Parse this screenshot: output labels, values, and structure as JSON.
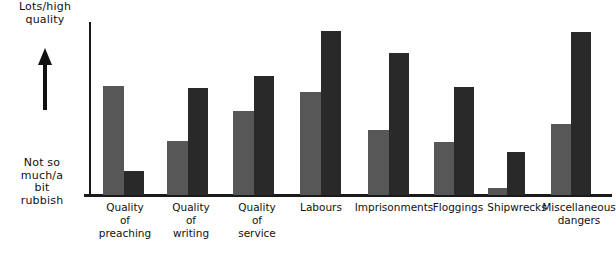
{
  "chart_data": {
    "type": "bar",
    "title": "",
    "subtitle": "",
    "xlabel": "",
    "ylabel": "",
    "grid": false,
    "legend": "none",
    "axis_annotations": {
      "y_top": "Lots/high\nquality",
      "y_bottom": "Not so\nmuch/a\nbit\nrubbish",
      "y_arrow": "up-arrow"
    },
    "ylim": [
      0,
      100
    ],
    "categories": [
      "Quality\nof\npreaching",
      "Quality\nof\nwriting",
      "Quality\nof\nservice",
      "Labours",
      "Imprisonments",
      "Floggings",
      "Shipwrecks",
      "Miscellaneous\ndangers"
    ],
    "series": [
      {
        "name": "light-series",
        "color": "#575757",
        "values": [
          63,
          31,
          49,
          60,
          38,
          31,
          4,
          41
        ]
      },
      {
        "name": "dark-series",
        "color": "#292929",
        "values": [
          14,
          62,
          69,
          95,
          82,
          62,
          25,
          94
        ]
      }
    ]
  },
  "bars": [
    {
      "category_index": 0,
      "series": "light",
      "x": 103,
      "width": 21,
      "top": 86,
      "value": 63
    },
    {
      "category_index": 0,
      "series": "dark",
      "x": 124,
      "width": 20,
      "top": 171,
      "value": 14
    },
    {
      "category_index": 1,
      "series": "light",
      "x": 167,
      "width": 21,
      "top": 141,
      "value": 31
    },
    {
      "category_index": 1,
      "series": "dark",
      "x": 188,
      "width": 20,
      "top": 88,
      "value": 62
    },
    {
      "category_index": 2,
      "series": "light",
      "x": 233,
      "width": 21,
      "top": 111,
      "value": 49
    },
    {
      "category_index": 2,
      "series": "dark",
      "x": 254,
      "width": 20,
      "top": 76,
      "value": 69
    },
    {
      "category_index": 3,
      "series": "light",
      "x": 300,
      "width": 21,
      "top": 92,
      "value": 60
    },
    {
      "category_index": 3,
      "series": "dark",
      "x": 321,
      "width": 20,
      "top": 31,
      "value": 95
    },
    {
      "category_index": 4,
      "series": "light",
      "x": 368,
      "width": 21,
      "top": 130,
      "value": 38
    },
    {
      "category_index": 4,
      "series": "dark",
      "x": 389,
      "width": 20,
      "top": 53,
      "value": 82
    },
    {
      "category_index": 5,
      "series": "light",
      "x": 434,
      "width": 20,
      "top": 142,
      "value": 31
    },
    {
      "category_index": 5,
      "series": "dark",
      "x": 454,
      "width": 20,
      "top": 87,
      "value": 62
    },
    {
      "category_index": 6,
      "series": "light",
      "x": 488,
      "width": 19,
      "top": 188,
      "value": 4
    },
    {
      "category_index": 6,
      "series": "dark",
      "x": 507,
      "width": 18,
      "top": 152,
      "value": 25
    },
    {
      "category_index": 7,
      "series": "light",
      "x": 551,
      "width": 20,
      "top": 124,
      "value": 41
    },
    {
      "category_index": 7,
      "series": "dark",
      "x": 571,
      "width": 20,
      "top": 32,
      "value": 94
    }
  ],
  "category_label_positions": [
    {
      "x": 93,
      "width": 64
    },
    {
      "x": 159,
      "width": 64
    },
    {
      "x": 225,
      "width": 64
    },
    {
      "x": 290,
      "width": 62
    },
    {
      "x": 351,
      "width": 86
    },
    {
      "x": 427,
      "width": 62
    },
    {
      "x": 484,
      "width": 66
    },
    {
      "x": 542,
      "width": 74
    }
  ],
  "colors": {
    "light_bar": "#575757",
    "dark_bar": "#292929",
    "axis": "#1a1a1a",
    "text": "#111111",
    "background": "#ffffff"
  }
}
